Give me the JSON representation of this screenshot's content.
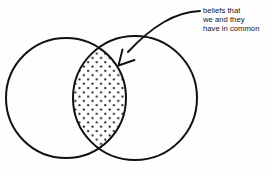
{
  "diagram": {
    "type": "venn-diagram",
    "title": "",
    "background_color": "#fefefe",
    "stroke_color": "#111111",
    "annotation": {
      "lines": [
        "beliefs that",
        "we and they",
        "have in common"
      ],
      "full_text": "beliefs that we and they have in common",
      "text_color": "#121212",
      "pointer": "arrow-pointing-to-intersection"
    },
    "sets": [
      {
        "name": "left-circle",
        "label": "",
        "cx": 66,
        "cy": 98,
        "r": 60,
        "fill": "none"
      },
      {
        "name": "right-circle",
        "label": "",
        "cx": 135,
        "cy": 98,
        "r": 62,
        "fill": "none"
      }
    ],
    "intersection": {
      "name": "intersection-region",
      "label": "",
      "fill_pattern": "stipple-dots",
      "dot_color": "#1a1a1a"
    }
  }
}
